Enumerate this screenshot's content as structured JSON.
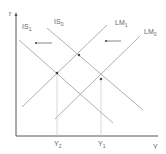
{
  "diagram": {
    "axes": {
      "y_label": "r",
      "x_label": "Y"
    },
    "curves": [
      {
        "id": "IS1",
        "label": "IS",
        "sub": "1"
      },
      {
        "id": "IS0",
        "label": "IS",
        "sub": "0"
      },
      {
        "id": "LM1",
        "label": "LM",
        "sub": "1"
      },
      {
        "id": "LM0",
        "label": "LM",
        "sub": "0"
      }
    ],
    "x_ticks": [
      {
        "label": "Y",
        "sub": "2"
      },
      {
        "label": "Y",
        "sub": "1"
      }
    ],
    "colors": {
      "line": "#b0b0b0",
      "axis": "#555555",
      "text": "#666666"
    }
  }
}
